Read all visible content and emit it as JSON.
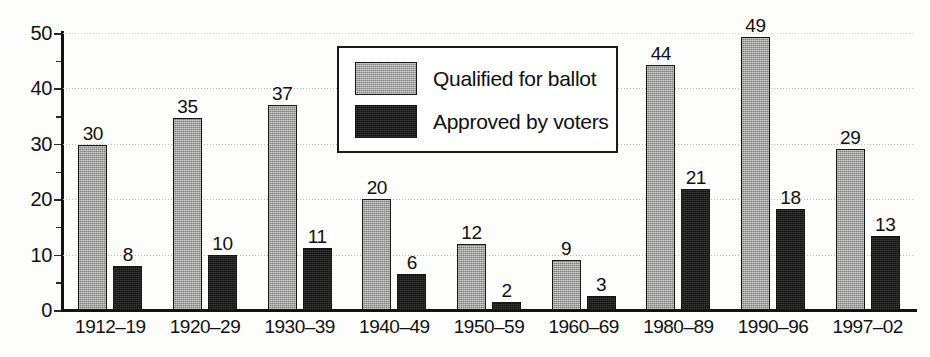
{
  "chart_data": {
    "type": "bar",
    "title": "",
    "xlabel": "",
    "ylabel": "",
    "ylim": [
      0,
      50
    ],
    "yticks": [
      0,
      10,
      20,
      30,
      40,
      50
    ],
    "ytick_labels": [
      "0",
      "10",
      "20",
      "30",
      "40",
      "50"
    ],
    "minor_tick_step": 5,
    "grid": "horizontal-dotted",
    "legend_position": "upper-center-right",
    "categories": [
      "1912–19",
      "1920–29",
      "1930–39",
      "1940–49",
      "1950–59",
      "1960–69",
      "1980–89",
      "1990–96",
      "1997–02"
    ],
    "series": [
      {
        "name": "Qualified for ballot",
        "color": "#9d9d9d",
        "values": [
          30,
          35,
          37,
          20,
          12,
          9,
          44,
          49,
          29
        ],
        "drawn_heights": [
          29.8,
          34.6,
          37.0,
          20.0,
          12.0,
          9.0,
          44.2,
          49.3,
          29.1
        ]
      },
      {
        "name": "Approved by voters",
        "color": "#1d1d1d",
        "values": [
          8,
          10,
          11,
          6,
          2,
          3,
          21,
          18,
          13
        ],
        "drawn_heights": [
          8.0,
          10.0,
          11.2,
          6.5,
          1.5,
          2.5,
          21.8,
          18.2,
          13.4
        ]
      }
    ]
  },
  "legend": {
    "items": [
      {
        "label": "Qualified for ballot",
        "swatch": "qualified"
      },
      {
        "label": "Approved by voters",
        "swatch": "approved"
      }
    ]
  }
}
